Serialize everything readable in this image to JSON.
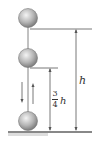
{
  "diagram": {
    "labels": {
      "full_height": "h",
      "rebound_numerator": "3",
      "rebound_denominator": "4",
      "rebound_variable": "h"
    },
    "colors": {
      "ball_light": "#e8e8e8",
      "ball_dark": "#8a8a8a",
      "line": "#555555",
      "ground": "#777777"
    },
    "balls": [
      {
        "position": "top",
        "cy": 18
      },
      {
        "position": "middle",
        "cy": 58
      },
      {
        "position": "bottom",
        "cy": 122
      }
    ],
    "arrows": [
      {
        "direction": "down"
      },
      {
        "direction": "up"
      }
    ]
  }
}
